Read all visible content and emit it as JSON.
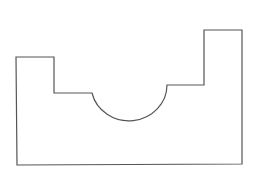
{
  "diagram": {
    "type": "line-drawing",
    "stroke_color": "#555555",
    "background": "#ffffff",
    "outline_path": "M16 57 L54 57 L54 93 L92 93 A38 36 0 0 0 167 85 L204 85 L204 30 L242 30 L242 164 L17 165 Z"
  }
}
